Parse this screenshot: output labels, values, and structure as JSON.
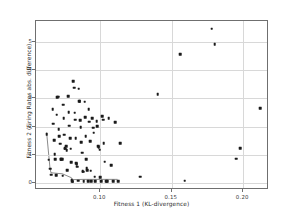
{
  "chart_data": {
    "type": "scatter",
    "title": "",
    "xlabel": "Fitness 1 (KL-divergence)",
    "ylabel": "Fitness 2 (Firing Rates abs. difference)",
    "xlim": [
      0.055,
      0.218
    ],
    "ylim": [
      -0.25,
      5.75
    ],
    "xticks": [
      0.1,
      0.15,
      0.2
    ],
    "xticklabels": [
      "0.10",
      "0.15",
      "0.20"
    ],
    "yticks": [
      0,
      1,
      2,
      3,
      4,
      5
    ],
    "yticklabels": [
      "0",
      "1",
      "2",
      "3",
      "4",
      "5"
    ],
    "grid": true,
    "legend": null,
    "marker_color": "#1a1a1a",
    "grid_color": "#d8d8d8",
    "frame_color": "#6f6f6f",
    "points": [
      [
        0.0625,
        1.74
      ],
      [
        0.064,
        0.82
      ],
      [
        0.0648,
        0.5
      ],
      [
        0.0655,
        0.3
      ],
      [
        0.0668,
        2.62
      ],
      [
        0.0672,
        2.1
      ],
      [
        0.0676,
        1.52
      ],
      [
        0.068,
        1.02
      ],
      [
        0.0684,
        0.84
      ],
      [
        0.069,
        0.28
      ],
      [
        0.0695,
        2.42
      ],
      [
        0.07,
        3.05
      ],
      [
        0.0705,
        3.06
      ],
      [
        0.071,
        1.9
      ],
      [
        0.0714,
        1.66
      ],
      [
        0.0718,
        1.4
      ],
      [
        0.0722,
        0.84
      ],
      [
        0.0726,
        0.84
      ],
      [
        0.0732,
        0.84
      ],
      [
        0.0736,
        0.26
      ],
      [
        0.074,
        2.78
      ],
      [
        0.0744,
        2.3
      ],
      [
        0.0748,
        1.72
      ],
      [
        0.0752,
        1.24
      ],
      [
        0.0756,
        1.22
      ],
      [
        0.076,
        1.3
      ],
      [
        0.0764,
        1.16
      ],
      [
        0.077,
        0.46
      ],
      [
        0.0775,
        3.08
      ],
      [
        0.078,
        2.52
      ],
      [
        0.0784,
        2.04
      ],
      [
        0.0788,
        1.58
      ],
      [
        0.0792,
        1.22
      ],
      [
        0.0796,
        0.74
      ],
      [
        0.08,
        0.12
      ],
      [
        0.0804,
        0.06
      ],
      [
        0.0808,
        0.05
      ],
      [
        0.0812,
        3.62
      ],
      [
        0.0816,
        3.38
      ],
      [
        0.082,
        2.5
      ],
      [
        0.0824,
        2.24
      ],
      [
        0.0828,
        1.58
      ],
      [
        0.0832,
        0.7
      ],
      [
        0.0836,
        0.66
      ],
      [
        0.084,
        0.58
      ],
      [
        0.0844,
        0.08
      ],
      [
        0.0848,
        3.34
      ],
      [
        0.0852,
        2.9
      ],
      [
        0.0856,
        2.9
      ],
      [
        0.086,
        2.22
      ],
      [
        0.0864,
        1.98
      ],
      [
        0.0868,
        1.44
      ],
      [
        0.0872,
        1.08
      ],
      [
        0.0876,
        0.42
      ],
      [
        0.088,
        0.4
      ],
      [
        0.0884,
        0.06
      ],
      [
        0.089,
        2.88
      ],
      [
        0.0894,
        2.34
      ],
      [
        0.0898,
        1.66
      ],
      [
        0.0902,
        0.84
      ],
      [
        0.0906,
        0.52
      ],
      [
        0.091,
        0.46
      ],
      [
        0.0914,
        0.06
      ],
      [
        0.092,
        2.62
      ],
      [
        0.0924,
        2.18
      ],
      [
        0.0928,
        1.48
      ],
      [
        0.0932,
        0.44
      ],
      [
        0.0936,
        0.06
      ],
      [
        0.0945,
        2.3
      ],
      [
        0.095,
        1.96
      ],
      [
        0.0955,
        1.78
      ],
      [
        0.096,
        0.22
      ],
      [
        0.0965,
        0.06
      ],
      [
        0.0975,
        2.2
      ],
      [
        0.098,
        2.02
      ],
      [
        0.0985,
        1.3
      ],
      [
        0.099,
        1.26
      ],
      [
        0.0995,
        1.18
      ],
      [
        0.1,
        0.2
      ],
      [
        0.1005,
        0.06
      ],
      [
        0.1015,
        2.36
      ],
      [
        0.102,
        2.24
      ],
      [
        0.1025,
        1.42
      ],
      [
        0.103,
        0.76
      ],
      [
        0.104,
        0.06
      ],
      [
        0.105,
        0.06
      ],
      [
        0.106,
        2.3
      ],
      [
        0.1075,
        0.64
      ],
      [
        0.109,
        0.06
      ],
      [
        0.1105,
        2.16
      ],
      [
        0.114,
        1.42
      ],
      [
        0.1125,
        0.06
      ],
      [
        0.128,
        0.22
      ],
      [
        0.14,
        3.16
      ],
      [
        0.156,
        4.58
      ],
      [
        0.159,
        0.08
      ],
      [
        0.178,
        5.48
      ],
      [
        0.18,
        4.92
      ],
      [
        0.195,
        0.86
      ],
      [
        0.198,
        1.24
      ],
      [
        0.212,
        2.66
      ]
    ],
    "pareto_front": [
      [
        0.0625,
        1.74
      ],
      [
        0.0648,
        0.5
      ],
      [
        0.0655,
        0.3
      ],
      [
        0.069,
        0.28
      ],
      [
        0.0736,
        0.26
      ],
      [
        0.08,
        0.12
      ],
      [
        0.0808,
        0.05
      ],
      [
        0.0884,
        0.06
      ],
      [
        0.0965,
        0.06
      ],
      [
        0.105,
        0.06
      ],
      [
        0.1125,
        0.06
      ]
    ]
  }
}
